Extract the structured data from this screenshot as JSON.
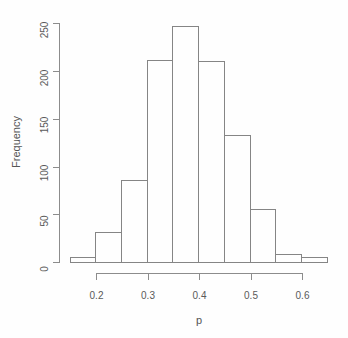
{
  "figure": {
    "background": "#fefefe",
    "line_color": "#8c8c8c",
    "text_color": "#5a5a5a"
  },
  "chart_data": {
    "type": "bar",
    "subtype": "histogram",
    "title": "",
    "xlabel": "p",
    "ylabel": "Frequency",
    "bin_edges": [
      0.15,
      0.2,
      0.25,
      0.3,
      0.35,
      0.4,
      0.45,
      0.5,
      0.55,
      0.6,
      0.65
    ],
    "frequencies": [
      5,
      31,
      86,
      211,
      247,
      210,
      133,
      56,
      8,
      5
    ],
    "x_ticks": [
      0.2,
      0.3,
      0.4,
      0.5,
      0.6
    ],
    "x_tick_labels": [
      "0.2",
      "0.3",
      "0.4",
      "0.5",
      "0.6"
    ],
    "y_ticks": [
      0,
      50,
      100,
      150,
      200,
      250
    ],
    "y_tick_labels": [
      "0",
      "50",
      "100",
      "150",
      "200",
      "250"
    ],
    "xlim": [
      0.15,
      0.65
    ],
    "ylim": [
      0,
      250
    ],
    "grid": "off",
    "legend": "none",
    "bar_fill": "#fefefe",
    "bar_border": "#858585"
  }
}
